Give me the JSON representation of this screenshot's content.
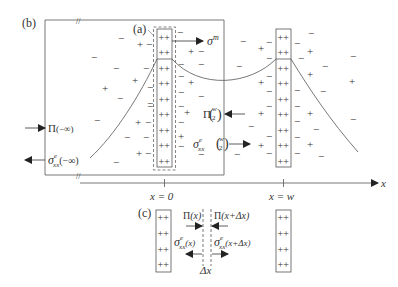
{
  "panels": {
    "a": {
      "label": "(a)"
    },
    "b": {
      "label": "(b)"
    },
    "c": {
      "label": "(c)"
    }
  },
  "axis": {
    "label": "x",
    "ticks": [
      {
        "label": "x = 0"
      },
      {
        "label": "x = w"
      }
    ],
    "break_mark": "//"
  },
  "annotations": {
    "sigma_m": {
      "base": "σ",
      "sup": "m"
    },
    "pi_minus_inf": {
      "base": "Π",
      "arg": "(−∞)"
    },
    "sigma_e_minus_inf": {
      "base": "σ",
      "sup": "e",
      "sub": "xx",
      "arg": "(−∞)"
    },
    "pi_w2": {
      "base": "Π",
      "num": "w",
      "den": "2"
    },
    "sigma_e_w2": {
      "base": "σ",
      "sup": "e",
      "sub": "xx",
      "num": "w",
      "den": "2"
    },
    "pi_x": {
      "base": "Π",
      "arg": "(x)"
    },
    "pi_x_dx": {
      "base": "Π",
      "arg": "(x+Δx)"
    },
    "sigma_e_x": {
      "base": "σ",
      "sup": "e",
      "sub": "xx",
      "arg": "(x)"
    },
    "sigma_e_x_dx": {
      "base": "σ",
      "sup": "e",
      "sub": "xx",
      "arg": "(x+Δx)"
    },
    "delta_x": {
      "label": "Δx"
    }
  },
  "charges": {
    "plus": "+",
    "minus": "−",
    "double_plus": "++"
  },
  "colors": {
    "line": "#555555",
    "text": "#333333",
    "fill_arrow": "#222222"
  }
}
